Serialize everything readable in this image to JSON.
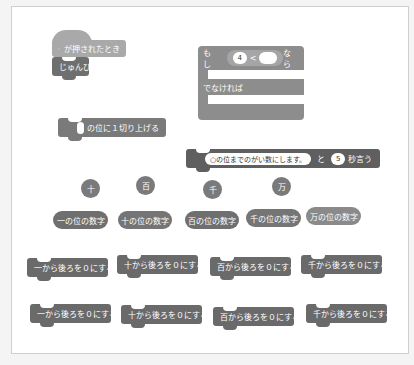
{
  "colors": {
    "canvas_bg": "#ffffff",
    "frame_border": "#cfcfcf",
    "hat_block": "#a9a9a9",
    "ready_block": "#6f6f6f",
    "if_else_block": "#8d8d8d",
    "round_up_block": "#7a7a7a",
    "say_block": "#5f5f5f"
  },
  "hat_block": {
    "icon": "green-flag-icon",
    "label": "が押されたとき"
  },
  "ready_block": {
    "label": "じゅんび"
  },
  "if_else": {
    "if_label": "もし",
    "left_value": "4",
    "operator": "<",
    "right_value": "",
    "then_label": "なら",
    "else_label": "でなければ"
  },
  "round_up_block": {
    "input_value": "",
    "label": "の位に１切り上げる"
  },
  "say_block": {
    "message": "○の位までのがい数にします。",
    "and_label": "と",
    "seconds": "5",
    "suffix": "秒言う"
  },
  "place_reporters": [
    "十",
    "百",
    "千",
    "万"
  ],
  "digit_reporters": [
    "一の位の数字",
    "十の位の数字",
    "百の位の数字",
    "千の位の数字",
    "万の位の数字"
  ],
  "zero_blocks_row1": [
    "一から後ろを０にする",
    "十から後ろを０にする",
    "百から後ろを０にする",
    "千から後ろを０にする"
  ],
  "zero_blocks_row2": [
    "一から後ろを０にする",
    "十から後ろを０にする",
    "百から後ろを０にする",
    "千から後ろを０にする"
  ]
}
